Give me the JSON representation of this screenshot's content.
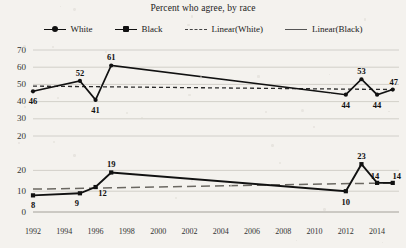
{
  "title": "Percent who agree, by race",
  "legend": [
    {
      "label": "White",
      "marker": "diamond-line-marker",
      "style": "solid-with-marker"
    },
    {
      "label": "Black",
      "marker": "square-line-marker",
      "style": "solid-with-marker"
    },
    {
      "label": "Linear(White)",
      "marker": "dashed-line-sample",
      "style": "short-dashed"
    },
    {
      "label": "Linear(Black)",
      "marker": "long-dashed-line-sample",
      "style": "long-dashed"
    }
  ],
  "xaxis": {
    "ticks": [
      "1992",
      "1994",
      "1996",
      "1998",
      "2000",
      "2002",
      "2004",
      "2006",
      "2008",
      "2010",
      "2012",
      "2014"
    ],
    "min": 1992,
    "max": 2015
  },
  "panels": [
    {
      "name": "white",
      "yticks": [
        "70",
        "60",
        "50",
        "40",
        "30",
        "20"
      ],
      "ymin": 20,
      "ymax": 70
    },
    {
      "name": "black",
      "yticks": [
        "20",
        "10",
        "0"
      ],
      "ymin": 0,
      "ymax": 25
    }
  ],
  "chart_data": {
    "type": "line",
    "title": "Percent who agree, by race",
    "xlabel": "",
    "ylabel": "",
    "grid": true,
    "legend_position": "top-center",
    "panels": [
      {
        "panel": "top",
        "ylim": [
          20,
          70
        ],
        "yticks": [
          20,
          30,
          40,
          50,
          60,
          70
        ],
        "series": [
          {
            "name": "White",
            "x": [
              1992,
              1995,
              1996,
              1997,
              2012,
              2013,
              2014,
              2015
            ],
            "values": [
              46,
              52,
              41,
              61,
              44,
              53,
              44,
              47
            ],
            "labels": [
              "46",
              "52",
              "41",
              "61",
              "44",
              "53",
              "44",
              "47"
            ]
          },
          {
            "name": "Linear(White)",
            "type": "trendline",
            "style": "short-dashed",
            "x": [
              1992,
              2015
            ],
            "values": [
              49,
              47
            ]
          }
        ]
      },
      {
        "panel": "bottom",
        "ylim": [
          0,
          25
        ],
        "yticks": [
          0,
          10,
          20
        ],
        "series": [
          {
            "name": "Black",
            "x": [
              1992,
              1995,
              1996,
              1997,
              2012,
              2013,
              2014,
              2015
            ],
            "values": [
              8,
              9,
              12,
              19,
              10,
              23,
              14,
              14
            ],
            "labels": [
              "8",
              "9",
              "12",
              "19",
              "10",
              "23",
              "14",
              "14"
            ]
          },
          {
            "name": "Linear(Black)",
            "type": "trendline",
            "style": "long-dashed",
            "x": [
              1992,
              2015
            ],
            "values": [
              11,
              14
            ]
          }
        ]
      }
    ]
  }
}
